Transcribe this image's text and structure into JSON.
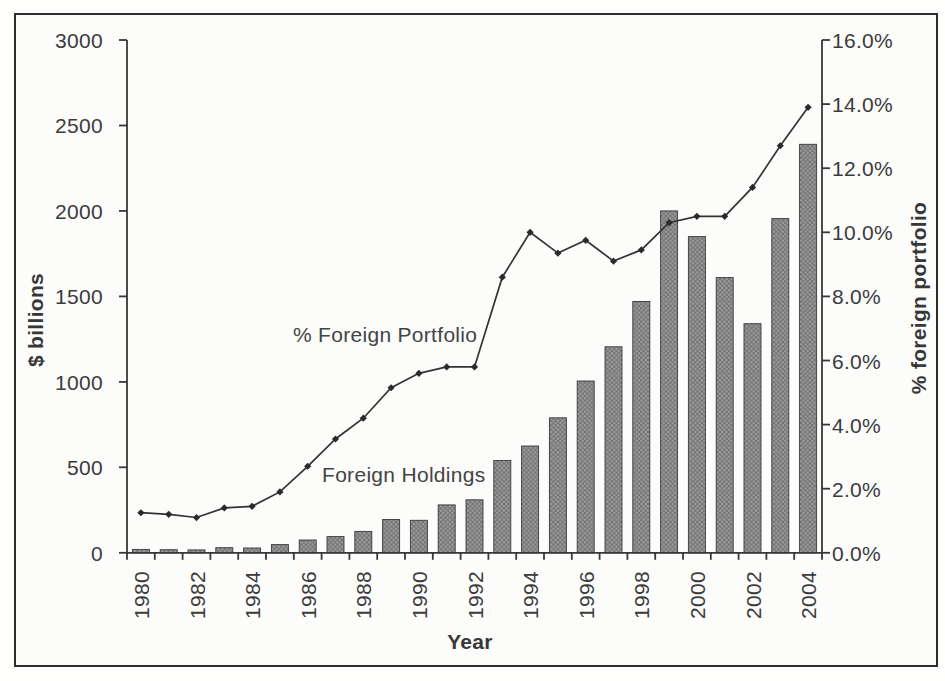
{
  "figure": {
    "left_axis_title": "$ billions",
    "right_axis_title": "% foreign portfolio",
    "x_axis_title": "Year",
    "line_series_label": "% Foreign Portfolio",
    "bar_series_label": "Foreign Holdings"
  },
  "colors": {
    "axis": "#383838",
    "text": "#3b3b3b",
    "line": "#333333",
    "marker": "#2b2b2b",
    "bar_base": "#9e9e9e",
    "bar_hatch": "#727272",
    "bar_stroke": "#3a3a3a",
    "frame_border": "#2d2d2d",
    "background": "#fcfcfb"
  },
  "chart_data": {
    "type": "bar",
    "title": "",
    "xlabel": "Year",
    "ylabel_left": "$ billions",
    "ylabel_right": "% foreign portfolio",
    "grid": false,
    "legend_position": "in-plot annotations",
    "categories": [
      1980,
      1981,
      1982,
      1983,
      1984,
      1985,
      1986,
      1987,
      1988,
      1989,
      1990,
      1991,
      1992,
      1993,
      1994,
      1995,
      1996,
      1997,
      1998,
      1999,
      2000,
      2001,
      2002,
      2003,
      2004
    ],
    "series": [
      {
        "name": "Foreign Holdings",
        "type": "bar",
        "axis": "left",
        "values": [
          20,
          18,
          17,
          30,
          28,
          48,
          75,
          95,
          125,
          195,
          190,
          280,
          310,
          540,
          625,
          790,
          1005,
          1205,
          1470,
          2000,
          1850,
          1610,
          1340,
          1955,
          2390
        ]
      },
      {
        "name": "% Foreign Portfolio",
        "type": "line",
        "axis": "right",
        "values": [
          1.25,
          1.2,
          1.1,
          1.4,
          1.45,
          1.9,
          2.7,
          3.55,
          4.2,
          5.15,
          5.6,
          5.8,
          5.8,
          8.6,
          10.0,
          9.35,
          9.75,
          9.1,
          9.45,
          10.3,
          10.5,
          10.5,
          11.4,
          12.7,
          13.9
        ]
      }
    ],
    "ylim_left": [
      0,
      3000
    ],
    "ylim_right": [
      0,
      16
    ],
    "left_tick_labels": [
      "0",
      "500",
      "1000",
      "1500",
      "2000",
      "2500",
      "3000"
    ],
    "right_tick_labels": [
      "0.0%",
      "2.0%",
      "4.0%",
      "6.0%",
      "8.0%",
      "10.0%",
      "12.0%",
      "14.0%",
      "16.0%"
    ],
    "x_tick_labels": [
      "1980",
      "1982",
      "1984",
      "1986",
      "1988",
      "1990",
      "1992",
      "1994",
      "1996",
      "1998",
      "2000",
      "2002",
      "2004"
    ]
  }
}
